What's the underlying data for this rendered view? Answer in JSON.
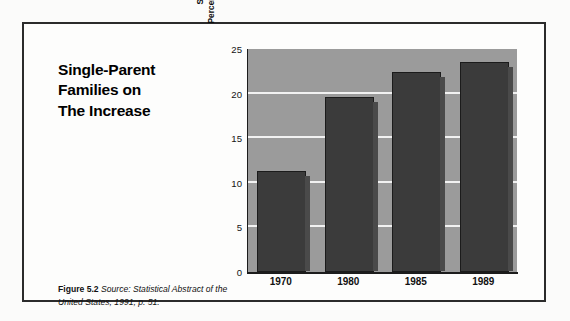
{
  "figure": {
    "title_lines": [
      "Single-Parent",
      "Families on",
      "The Increase"
    ],
    "caption_label": "Figure 5.2",
    "caption_text": "Source: Statistical Abstract of the United States, 1991, p. 51.",
    "frame_color": "#2b2b2b",
    "page_background": "#fbfbfa"
  },
  "chart_data": {
    "type": "bar",
    "title": "Single-Parent Families on The Increase",
    "categories": [
      "1970",
      "1980",
      "1985",
      "1989"
    ],
    "values": [
      11.3,
      19.6,
      22.4,
      23.6
    ],
    "xlabel": "",
    "ylabel_lines": [
      "Single-Parent Families as a",
      "Percentage of Families with Children"
    ],
    "ylabel": "Single-Parent Families as a Percentage of Families with Children",
    "ylim": [
      0,
      25
    ],
    "yticks": [
      0,
      5,
      10,
      15,
      20,
      25
    ],
    "ytick_labels": [
      "0",
      "5",
      "10",
      "15",
      "20",
      "25"
    ],
    "grid": true,
    "gridline_color": "#f2f2f2",
    "legend": false,
    "plot_background": "#9b9b9b",
    "bar_color": "#3b3b3b",
    "bar_edge_color": "#1b1b1b",
    "axis_color": "#1c1c1c",
    "source": "Statistical Abstract of the United States, 1991, p. 51."
  }
}
